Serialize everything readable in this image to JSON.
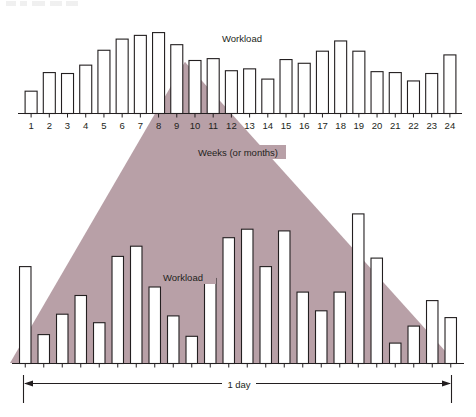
{
  "figure": {
    "title": "",
    "background_color": "#ffffff",
    "triangle_color": "#b8a0a7",
    "line_color": "#231f20",
    "bar_fill": "#ffffff"
  },
  "top_chart": {
    "workload_label": "Workload",
    "axis_label": "Weeks (or months)",
    "tick_labels": [
      "1",
      "2",
      "3",
      "4",
      "5",
      "6",
      "7",
      "8",
      "9",
      "10",
      "11",
      "12",
      "13",
      "14",
      "15",
      "16",
      "17",
      "18",
      "19",
      "20",
      "21",
      "22",
      "23",
      "24"
    ]
  },
  "bottom_chart": {
    "workload_label": "Workload",
    "span_label": "1 day"
  },
  "chart_data": [
    {
      "type": "bar",
      "id": "weeks-workload",
      "title": "Workload",
      "xlabel": "Weeks (or months)",
      "ylabel": "Workload",
      "grid": false,
      "legend": "none",
      "ylim": [
        0,
        100
      ],
      "categories": [
        "1",
        "2",
        "3",
        "4",
        "5",
        "6",
        "7",
        "8",
        "9",
        "10",
        "11",
        "12",
        "13",
        "14",
        "15",
        "16",
        "17",
        "18",
        "19",
        "20",
        "21",
        "22",
        "23",
        "24"
      ],
      "values": [
        24,
        44,
        43,
        52,
        68,
        80,
        84,
        87,
        74,
        57,
        59,
        46,
        48,
        37,
        58,
        54,
        67,
        78,
        67,
        45,
        44,
        35,
        43,
        63
      ],
      "annotation": "Zoomed detail triangle spans weeks 8 through 13 and expands into the lower chart"
    },
    {
      "type": "bar",
      "id": "one-day-workload",
      "title": "Workload",
      "xlabel": "1 day",
      "ylabel": "Workload",
      "grid": false,
      "legend": "none",
      "ylim": [
        0,
        100
      ],
      "categories": [
        "1",
        "2",
        "3",
        "4",
        "5",
        "6",
        "7",
        "8",
        "9",
        "10",
        "11",
        "12",
        "13",
        "14",
        "15",
        "16",
        "17",
        "18",
        "19",
        "20",
        "21",
        "22",
        "23",
        "24"
      ],
      "values": [
        57,
        17,
        29,
        40,
        24,
        63,
        69,
        45,
        28,
        16,
        50,
        74,
        79,
        57,
        78,
        42,
        31,
        42,
        88,
        62,
        12,
        22,
        37,
        27
      ]
    }
  ]
}
